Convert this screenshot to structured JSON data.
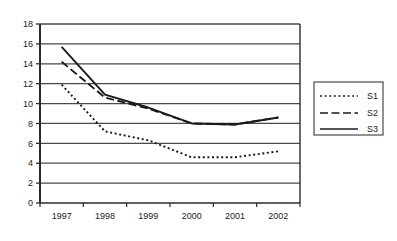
{
  "chart_data": {
    "type": "line",
    "title": "",
    "xlabel": "",
    "ylabel": "",
    "categories": [
      "1997",
      "1998",
      "1999",
      "2000",
      "2001",
      "2002"
    ],
    "ylim": [
      0,
      18
    ],
    "ytick_step": 2,
    "yticks": [
      "0",
      "2",
      "4",
      "6",
      "8",
      "10",
      "12",
      "14",
      "16",
      "18"
    ],
    "grid": true,
    "grid_axis": "y",
    "legend_position": "right-outside",
    "series": [
      {
        "name": "S1",
        "style": "dotted",
        "color": "#1a1a1a",
        "values": [
          11.9,
          7.2,
          6.3,
          4.6,
          4.6,
          5.2
        ]
      },
      {
        "name": "S2",
        "style": "dashed",
        "color": "#1a1a1a",
        "values": [
          14.2,
          10.6,
          9.5,
          8.0,
          7.9,
          8.6
        ]
      },
      {
        "name": "S3",
        "style": "solid",
        "color": "#1a1a1a",
        "values": [
          15.7,
          10.9,
          9.6,
          8.0,
          7.9,
          8.6
        ]
      }
    ]
  },
  "legend": {
    "entries": [
      {
        "label": "S1"
      },
      {
        "label": "S2"
      },
      {
        "label": "S3"
      }
    ]
  }
}
